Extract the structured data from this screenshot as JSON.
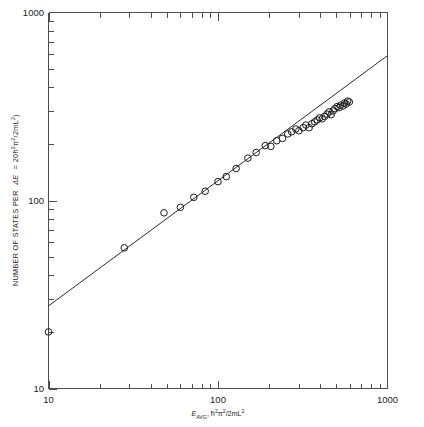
{
  "figure": {
    "background_color": "#ffffff",
    "line_color": "#2b2b2b",
    "marker_color": "#1a1a1a",
    "axis_color": "#4d4d4d"
  },
  "labels": {
    "y_axis_title": "NUMBER OF STATES PER ΔE = 20ħ²π²/2mL²",
    "y_axis_title_plain": "NUMBER OF STATES PER",
    "y_axis_title_delta": "ΔE",
    "y_axis_title_eq": "= 20ħ",
    "y_axis_title_tail": "π",
    "y_axis_title_tail2": "/2mL",
    "x_axis_title_main": "E",
    "x_axis_title_sub": "AVG",
    "x_axis_title_rest": ", ħ",
    "x_axis_title_rest2": "π",
    "x_axis_title_rest3": "/2mL",
    "x_axis_title_full": "E_AVG, ħ²π²/2mL²",
    "x_ticks": [
      "10",
      "100",
      "1000"
    ],
    "y_ticks": [
      "10",
      "100",
      "1000"
    ]
  },
  "chart_data": {
    "type": "scatter",
    "title": "",
    "xlabel": "E_AVG, ħ²π²/2mL²",
    "ylabel": "NUMBER OF STATES PER ΔE = 20ħ²π²/2mL²",
    "xscale": "log",
    "yscale": "log",
    "xlim": [
      10,
      1000
    ],
    "ylim": [
      10,
      1000
    ],
    "grid": false,
    "legend": false,
    "marker": "open-circle",
    "marker_size": 4.2,
    "series": [
      {
        "name": "states per energy interval",
        "x": [
          10,
          28,
          48,
          60,
          72,
          84,
          100,
          112,
          128,
          150,
          168,
          190,
          205,
          222,
          240,
          258,
          272,
          288,
          300,
          318,
          330,
          345,
          358,
          372,
          385,
          398,
          412,
          425,
          440,
          452,
          465,
          478,
          490,
          505,
          518,
          530,
          545,
          558,
          570,
          582,
          595
        ],
        "y": [
          20,
          56,
          86,
          92,
          104,
          112,
          126,
          134,
          148,
          168,
          180,
          196,
          194,
          208,
          214,
          226,
          232,
          240,
          235,
          244,
          252,
          244,
          256,
          262,
          268,
          275,
          272,
          280,
          288,
          296,
          286,
          300,
          308,
          316,
          312,
          322,
          318,
          330,
          326,
          338,
          334
        ]
      }
    ],
    "fit_line": {
      "name": "power-law fit",
      "description": "straight line on log-log axes",
      "x_start": 10,
      "y_start": 27.5,
      "x_end": 1000,
      "y_end": 590,
      "slope_loglog": 1.33
    },
    "annotations": []
  }
}
